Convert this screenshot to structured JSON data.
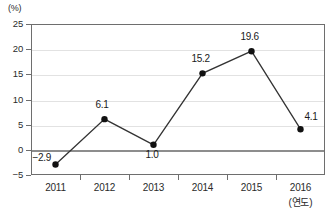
{
  "chart_data": {
    "type": "line",
    "title": "",
    "subtitle": "",
    "xlabel": "(연도)",
    "ylabel": "(%)",
    "categories": [
      "2011",
      "2012",
      "2013",
      "2014",
      "2015",
      "2016"
    ],
    "values": [
      -2.9,
      6.1,
      1.0,
      15.2,
      19.6,
      4.1
    ],
    "point_labels": [
      "-2.9",
      "6.1",
      "1.0",
      "15.2",
      "19.6",
      "4.1"
    ],
    "series": [
      {
        "name": "",
        "values": [
          -2.9,
          6.1,
          1.0,
          15.2,
          19.6,
          4.1
        ]
      }
    ],
    "ylim": [
      -5,
      25
    ],
    "yticks": [
      25,
      20,
      15,
      10,
      5,
      0,
      -5
    ],
    "ytick_labels": [
      "25",
      "20",
      "15",
      "10",
      "5",
      "0",
      "-5"
    ],
    "grid": true,
    "grid_axis": "y",
    "legend": false,
    "legend_position": "none",
    "zero_line": 0,
    "marker": "filled-circle",
    "colors": {
      "line": "#333333",
      "marker": "#111111",
      "grid": "#e2e2e2",
      "zero_line": "#8d8d8d",
      "frame": "#6e6e6e",
      "text": "#2b2b2b",
      "background": "#ffffff"
    }
  }
}
